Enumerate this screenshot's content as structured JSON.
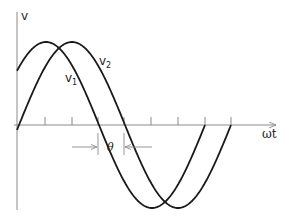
{
  "diagram": {
    "y_axis_label": "v",
    "x_axis_label": "ωt",
    "curves": [
      {
        "name": "v1",
        "label_base": "v",
        "label_sub": "1",
        "phase_offset_px": 0,
        "color": "#1a1a1a"
      },
      {
        "name": "v2",
        "label_base": "v",
        "label_sub": "2",
        "phase_offset_px": 26,
        "color": "#1a1a1a"
      }
    ],
    "phase_label": "θ",
    "axis_color": "#8a8a8a",
    "tick_count": 6
  }
}
